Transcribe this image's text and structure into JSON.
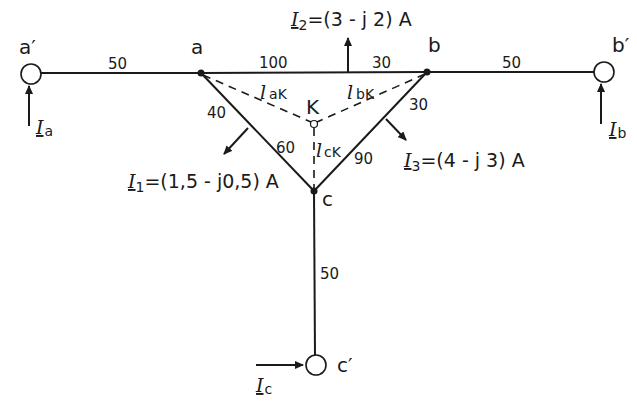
{
  "nodes": {
    "a_prime": "a′",
    "a": "a",
    "b": "b",
    "b_prime": "b′",
    "c": "c",
    "c_prime": "c′",
    "K": "K"
  },
  "line_lengths": {
    "a_prime_a": "50",
    "a_to_I2": "100",
    "I2_to_b": "30",
    "b_b_prime": "50",
    "a_to_I1": "40",
    "I1_to_c": "60",
    "b_to_I3": "30",
    "I3_to_c": "90",
    "c_c_prime": "50"
  },
  "dashed_lines": {
    "aK": {
      "symbol": "l",
      "sub": "aK"
    },
    "bK": {
      "symbol": "l",
      "sub": "bK"
    },
    "cK": {
      "symbol": "l",
      "sub": "cK"
    }
  },
  "loads": {
    "I1": {
      "symbol": "I",
      "sub": "1",
      "value": "=(1,5 - j0,5) A"
    },
    "I2": {
      "symbol": "I",
      "sub": "2",
      "value": "=(3 - j 2) A"
    },
    "I3": {
      "symbol": "I",
      "sub": "3",
      "value": "=(4 - j 3) A"
    }
  },
  "feeds": {
    "Ia": {
      "symbol": "I",
      "sub": "a"
    },
    "Ib": {
      "symbol": "I",
      "sub": "b"
    },
    "Ic": {
      "symbol": "I",
      "sub": "c"
    }
  },
  "colors": {
    "line": "#1a1a1a",
    "background": "#ffffff"
  }
}
